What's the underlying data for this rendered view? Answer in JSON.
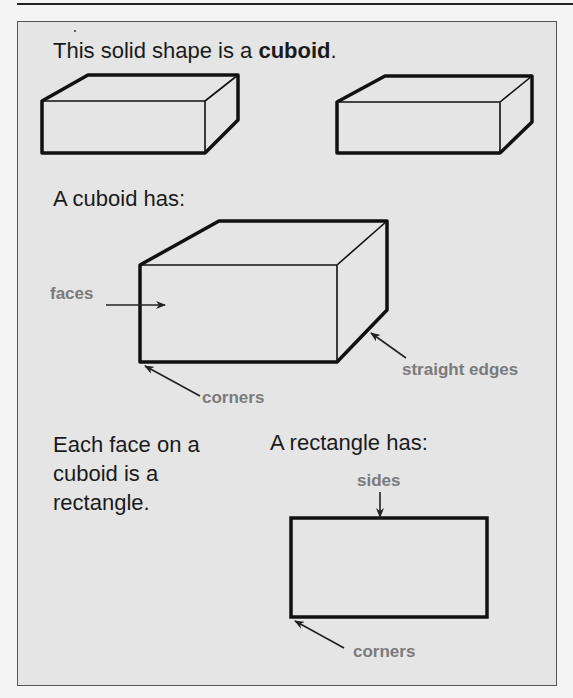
{
  "page": {
    "heading_prefix": "This solid shape is a ",
    "heading_bold": "cuboid",
    "heading_suffix": ".",
    "section_cuboid": {
      "title": "A cuboid has:",
      "labels": {
        "faces": "faces",
        "edges": "straight edges",
        "corners": "corners"
      }
    },
    "face_note": {
      "lines": [
        "Each face on a",
        "cuboid is a",
        "rectangle."
      ]
    },
    "section_rectangle": {
      "title": "A rectangle has:",
      "labels": {
        "sides": "sides",
        "corners": "corners"
      }
    }
  },
  "colors": {
    "panel_background": "#e5e5e5",
    "text": "#1b1b1b",
    "label": "#7b7b7b",
    "line": "#111111"
  }
}
